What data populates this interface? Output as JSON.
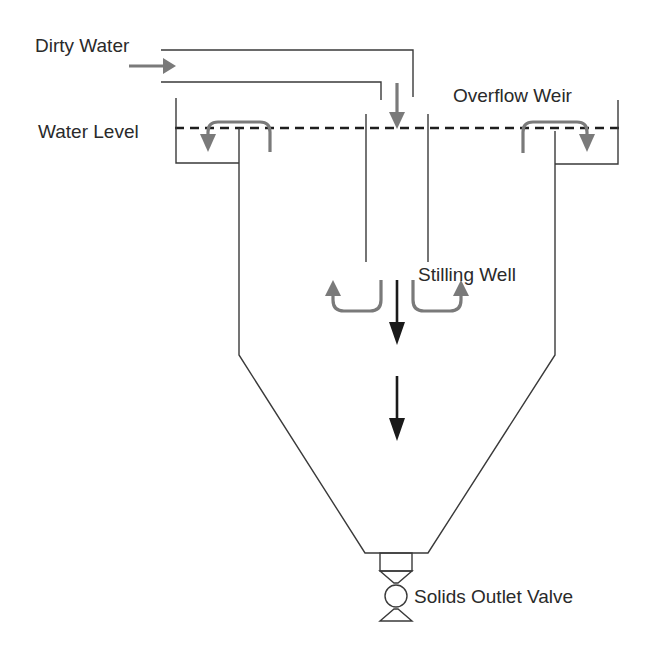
{
  "diagram": {
    "type": "clarifier-settling-tank",
    "labels": {
      "dirty_water": "Dirty Water",
      "water_level": "Water Level",
      "overflow_weir": "Overflow Weir",
      "stilling_well": "Stilling Well",
      "solids_outlet_valve": "Solids Outlet Valve"
    },
    "colors": {
      "structure": "#3a3a3a",
      "flow_arrow_gray": "#7a7a7a",
      "settling_arrow_black": "#1a1a1a",
      "water_level_dash": "#1e1e1e",
      "background": "#ffffff"
    },
    "components": [
      {
        "id": "inlet-pipe",
        "label_ref": "dirty_water"
      },
      {
        "id": "stilling-well",
        "label_ref": "stilling_well"
      },
      {
        "id": "left-overflow-weir",
        "label_ref": "overflow_weir"
      },
      {
        "id": "right-overflow-weir",
        "label_ref": "overflow_weir"
      },
      {
        "id": "conical-tank-bottom"
      },
      {
        "id": "solids-outlet-valve",
        "label_ref": "solids_outlet_valve"
      }
    ],
    "flows": [
      {
        "from": "inlet-pipe",
        "to": "stilling-well",
        "direction": "down"
      },
      {
        "from": "stilling-well",
        "to": "left-overflow-weir",
        "direction": "up-left"
      },
      {
        "from": "stilling-well",
        "to": "right-overflow-weir",
        "direction": "up-right"
      },
      {
        "from": "stilling-well",
        "to": "solids-outlet-valve",
        "direction": "down",
        "meaning": "settling solids"
      }
    ]
  }
}
